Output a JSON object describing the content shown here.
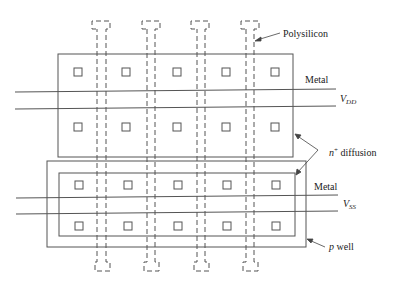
{
  "diagram": {
    "labels": {
      "polysilicon": "Polysilicon",
      "metal_top": "Metal",
      "vdd_main": "V",
      "vdd_sub": "DD",
      "n_diffusion_main": "n",
      "n_diffusion_sup": "+",
      "n_diffusion_rest": " diffusion",
      "metal_bottom": "Metal",
      "vss_main": "V",
      "vss_sub": "SS",
      "p_well_italic": "p",
      "p_well_rest": " well"
    },
    "colors": {
      "line": "#555555",
      "text": "#222222",
      "background": "#ffffff"
    },
    "structure": {
      "polysilicon_strips": 5,
      "contact_columns": 5,
      "contact_rows_per_region": 2,
      "regions": [
        "top n+ diffusion (VDD)",
        "bottom n+ diffusion in p well (VSS)"
      ]
    }
  }
}
